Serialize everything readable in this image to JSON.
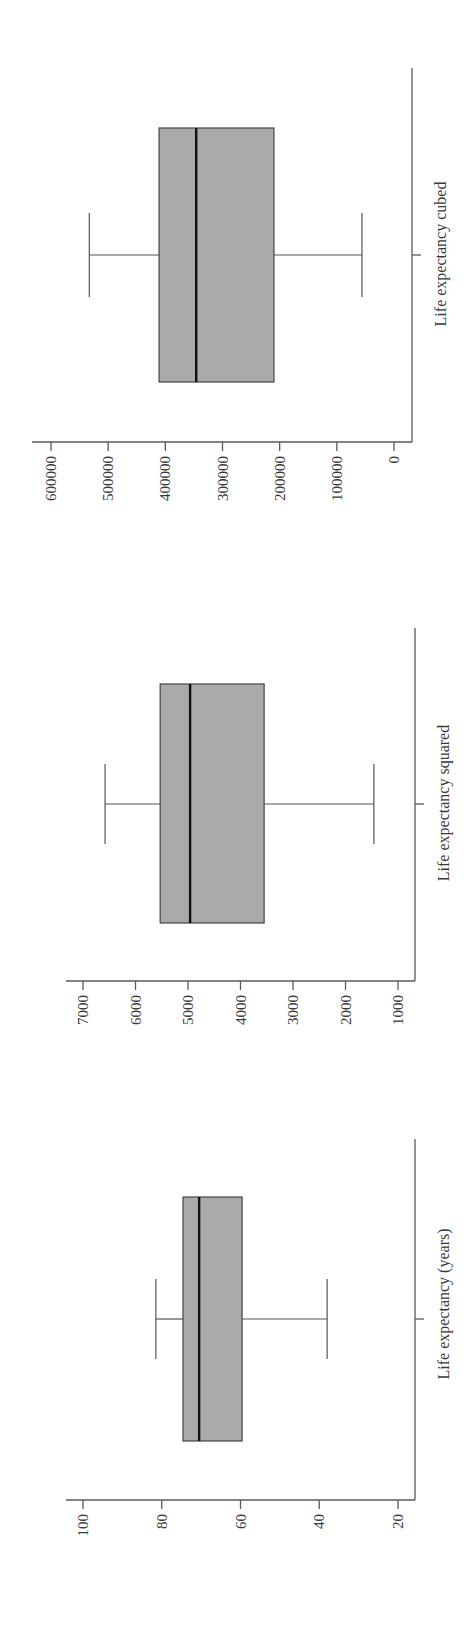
{
  "chart_data": [
    {
      "type": "boxplot",
      "orientation": "rotated-90deg (value axis runs horizontally, high values on left)",
      "category": "Life expectancy (years)",
      "ticks": [
        100,
        80,
        60,
        40,
        20
      ],
      "tick_labels": [
        "100",
        "80",
        "60",
        "40",
        "20"
      ],
      "ylim": [
        20,
        100
      ],
      "stats": {
        "whisker_high": 81.5,
        "q3": 74.6,
        "median": 70.5,
        "q1": 59.6,
        "whisker_low": 38
      },
      "grid": false
    },
    {
      "type": "boxplot",
      "orientation": "rotated-90deg (value axis runs horizontally, high values on left)",
      "category": "Life expectancy squared",
      "ticks": [
        7000,
        6000,
        5000,
        4000,
        3000,
        2000,
        1000
      ],
      "tick_labels": [
        "7000",
        "6000",
        "5000",
        "4000",
        "3000",
        "2000",
        "1000"
      ],
      "ylim": [
        1000,
        7000
      ],
      "stats": {
        "whisker_high": 6580,
        "q3": 5530,
        "median": 4960,
        "q1": 3550,
        "whisker_low": 1460
      },
      "grid": false
    },
    {
      "type": "boxplot",
      "orientation": "rotated-90deg (value axis runs horizontally, high values on left)",
      "category": "Life expectancy cubed",
      "ticks": [
        600000,
        500000,
        400000,
        300000,
        200000,
        100000,
        0
      ],
      "tick_labels": [
        "600000",
        "500000",
        "400000",
        "300000",
        "200000",
        "100000",
        "0"
      ],
      "ylim": [
        0,
        600000
      ],
      "stats": {
        "whisker_high": 533000,
        "q3": 411000,
        "median": 346000,
        "q1": 210000,
        "whisker_low": 56000
      },
      "grid": false
    }
  ],
  "panels": [
    {
      "id": "years",
      "label": "Life expectancy (years)",
      "layout": {
        "axis_y": 1500,
        "axis_x0": 66,
        "frame_x": 415,
        "frame_top": 1139,
        "px_hi": 83,
        "px_lo": 398,
        "v_hi": 100,
        "v_lo": 20,
        "center_y": 1319,
        "box_top": 1197,
        "box_bottom": 1441,
        "cap_half": 40,
        "label_y": 1304
      }
    },
    {
      "id": "squared",
      "label": "Life expectancy squared",
      "layout": {
        "axis_y": 981,
        "axis_x0": 66,
        "frame_x": 415,
        "frame_top": 628,
        "px_hi": 83,
        "px_lo": 398,
        "v_hi": 7000,
        "v_lo": 1000,
        "center_y": 804,
        "box_top": 684,
        "box_bottom": 923,
        "cap_half": 40,
        "label_y": 803
      }
    },
    {
      "id": "cubed",
      "label": "Life expectancy cubed",
      "layout": {
        "axis_y": 442,
        "axis_x0": 32,
        "frame_x": 412,
        "frame_top": 68,
        "px_hi": 51,
        "px_lo": 394,
        "v_hi": 600000,
        "v_lo": 0,
        "center_y": 255,
        "box_top": 128,
        "box_bottom": 382,
        "cap_half": 42,
        "label_y": 254
      }
    }
  ],
  "colors": {
    "box_fill": "#aaaaaa",
    "box_stroke": "#444444",
    "median": "#111111",
    "axis": "#5a5a5a",
    "text": "#3a3a3a"
  }
}
